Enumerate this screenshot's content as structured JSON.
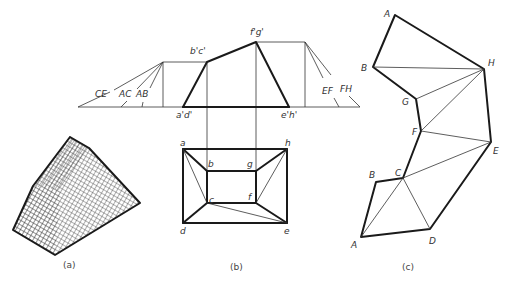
{
  "figure": {
    "panels": [
      {
        "id": "a",
        "caption": "(a)",
        "description": "Isometric hatched solid (frustum-like block)"
      },
      {
        "id": "b",
        "caption": "(b)",
        "description": "Front and top orthographic views with true-length construction"
      },
      {
        "id": "c",
        "caption": "(c)",
        "description": "Surface development by triangulation"
      }
    ]
  },
  "front_view": {
    "labels": {
      "ad": "a'd'",
      "bc": "b'c'",
      "fg": "f'g'",
      "eh": "e'h'",
      "ce": "CE",
      "ac": "AC",
      "ab": "AB",
      "ef": "EF",
      "fh": "FH"
    }
  },
  "top_view": {
    "labels": {
      "a": "a",
      "b": "b",
      "c": "c",
      "d": "d",
      "e": "e",
      "f": "f",
      "g": "g",
      "h": "h"
    }
  },
  "development": {
    "labels": {
      "A_top": "A",
      "B_top": "B",
      "G": "G",
      "H": "H",
      "F": "F",
      "E": "E",
      "C": "C",
      "B_bottom": "B",
      "A_bottom": "A",
      "D": "D"
    }
  },
  "colors": {
    "line": "#1a1a1a",
    "background": "#ffffff"
  }
}
